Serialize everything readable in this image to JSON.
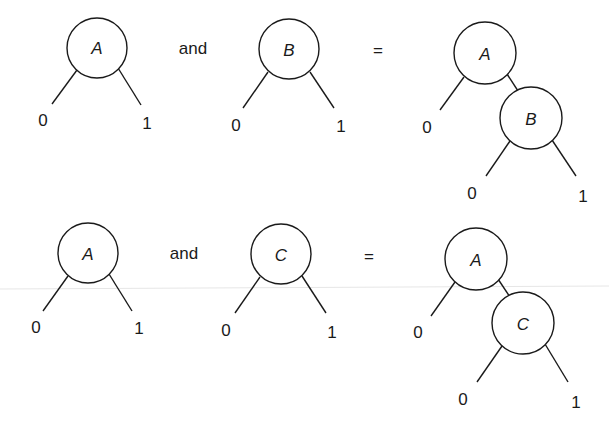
{
  "rows": [
    {
      "left": {
        "node": "A",
        "low": "0",
        "high": "1"
      },
      "operator": "and",
      "right": {
        "node": "B",
        "low": "0",
        "high": "1"
      },
      "equals": "=",
      "result": {
        "root": "A",
        "root_low": "0",
        "child": "B",
        "child_low": "0",
        "child_high": "1"
      }
    },
    {
      "left": {
        "node": "A",
        "low": "0",
        "high": "1"
      },
      "operator": "and",
      "right": {
        "node": "C",
        "low": "0",
        "high": "1"
      },
      "equals": "=",
      "result": {
        "root": "A",
        "root_low": "0",
        "child": "C",
        "child_low": "0",
        "child_high": "1"
      }
    }
  ],
  "colors": {
    "stroke": "#1a1a1a",
    "background": "#ffffff"
  }
}
